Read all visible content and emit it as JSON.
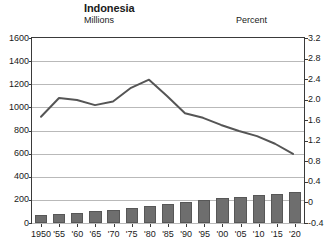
{
  "title": "Indonesia",
  "axis_unit_left": "Millions",
  "axis_unit_right": "Percent",
  "colors": {
    "bar_fill": "#6e6e6e",
    "bar_edge": "#575757",
    "line": "#555555",
    "grid": "#b9b9b9",
    "frame": "#3a3a3a",
    "text": "#1a1a1a"
  },
  "chart_data": {
    "type": "bar",
    "title": "Indonesia",
    "xlabel": "",
    "ylabel": "Millions",
    "ylabel_right": "Percent",
    "grid": true,
    "legend": "none",
    "ylim": [
      0,
      1600
    ],
    "ylim_right": [
      -0.4,
      3.2
    ],
    "yticks": [
      0,
      200,
      400,
      600,
      800,
      1000,
      1200,
      1400,
      1600
    ],
    "ytick_labels": [
      "0",
      "200",
      "400",
      "600",
      "800",
      "1000",
      "1200",
      "1400",
      "1600"
    ],
    "yticks_right": [
      -0.4,
      0,
      0.4,
      0.8,
      1.2,
      1.6,
      2.0,
      2.4,
      2.8,
      3.2
    ],
    "ytick_labels_right": [
      "-0.4",
      "0",
      "0.4",
      "0.8",
      "1.2",
      "1.6",
      "2.0",
      "2.4",
      "2.8",
      "3.2"
    ],
    "categories": [
      "1950",
      "'55",
      "'60",
      "'65",
      "'70",
      "'75",
      "'80",
      "'85",
      "'90",
      "'95",
      "'00",
      "'05",
      "'10",
      "'15",
      "'20"
    ],
    "x": [
      1950,
      1955,
      1960,
      1965,
      1970,
      1975,
      1980,
      1985,
      1990,
      1995,
      2000,
      2005,
      2010,
      2015,
      2020
    ],
    "series": [
      {
        "name": "Population",
        "type": "bar",
        "axis": "left",
        "unit": "Millions",
        "values": [
          70,
          78,
          88,
          101,
          115,
          130,
          147,
          165,
          181,
          196,
          212,
          226,
          241,
          255,
          267
        ]
      },
      {
        "name": "Growth rate",
        "type": "line",
        "axis": "right",
        "unit": "Percent",
        "values": [
          1.65,
          2.02,
          1.98,
          1.88,
          1.95,
          2.22,
          2.38,
          2.06,
          1.72,
          1.63,
          1.49,
          1.37,
          1.27,
          1.12,
          0.92
        ]
      }
    ]
  }
}
